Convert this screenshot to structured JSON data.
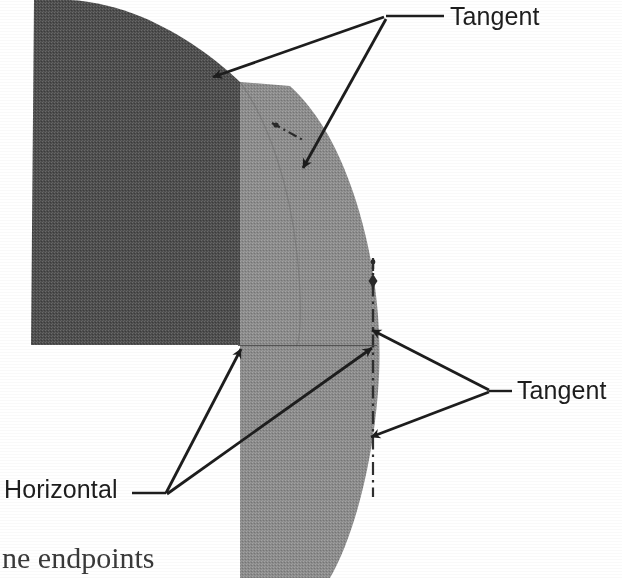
{
  "figure": {
    "kind": "scanned-textbook-geometry-diagram",
    "background_color": "#ffffff",
    "ink_color": "#1d1d1d",
    "regions": {
      "dark_region": {
        "name": "dark-shaded-region",
        "fill_color": "#555555",
        "description": "dark gray halftone region, left side, bounded above by a curve and below by a horizontal edge"
      },
      "light_region": {
        "name": "light-shaded-region",
        "fill_color": "#8c8c8c",
        "description": "medium gray halftone lens region, right side, bounded right by a circular arc"
      }
    },
    "centerline": {
      "name": "vertical-centerline",
      "style": "dash-dot",
      "color": "#3a3a3a"
    },
    "tangent_ticks": [
      {
        "name": "tangent-tick-upper",
        "style": "dash-dot"
      },
      {
        "name": "tangent-tick-lower",
        "style": "dash-dot"
      }
    ],
    "horizontal_segment": {
      "name": "horizontal-edge",
      "color": "#4a4a4a"
    }
  },
  "callouts": {
    "tangent_top": {
      "label": "Tangent",
      "arrow_count": 2,
      "anchor": "top-right"
    },
    "tangent_bottom": {
      "label": "Tangent",
      "arrow_count": 2,
      "anchor": "right"
    },
    "horizontal": {
      "label": "Horizontal",
      "arrow_count": 2,
      "anchor": "bottom-left"
    }
  },
  "page_text": {
    "cropped_line": "ne endpoints"
  }
}
